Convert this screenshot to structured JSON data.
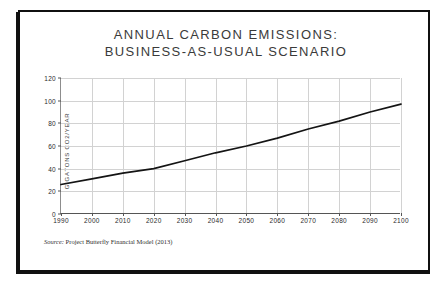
{
  "figure": {
    "title_line1": "ANNUAL CARBON EMISSIONS:",
    "title_line2": "BUSINESS-AS-USUAL SCENARIO",
    "source_label": "Source:",
    "source_text": "Project Butterfly Financial Model (2013)",
    "line_color": "#141414",
    "grid_color": "#d2d2d2",
    "axis_color": "#555555",
    "frame_color": "#101010",
    "background": "#ffffff"
  },
  "chart_data": {
    "type": "line",
    "title": "ANNUAL CARBON EMISSIONS: BUSINESS-AS-USUAL SCENARIO",
    "xlabel": "",
    "ylabel": "GIGATONS CO2/YEAR",
    "x": [
      1990,
      2000,
      2010,
      2020,
      2030,
      2040,
      2050,
      2060,
      2070,
      2080,
      2090,
      2100
    ],
    "values": [
      26,
      31,
      36,
      40,
      47,
      54,
      60,
      67,
      75,
      82,
      90,
      97
    ],
    "series": [
      {
        "name": "Business-as-usual emissions",
        "values": [
          26,
          31,
          36,
          40,
          47,
          54,
          60,
          67,
          75,
          82,
          90,
          97
        ]
      }
    ],
    "xlim": [
      1990,
      2100
    ],
    "ylim": [
      0,
      120
    ],
    "xticks": [
      1990,
      2000,
      2010,
      2020,
      2030,
      2040,
      2050,
      2060,
      2070,
      2080,
      2090,
      2100
    ],
    "yticks": [
      0,
      20,
      40,
      60,
      80,
      100,
      120
    ],
    "xtick_labels": [
      "1990",
      "2000",
      "2010",
      "2020",
      "2030",
      "2040",
      "2050",
      "2060",
      "2070",
      "2080",
      "2090",
      "2100"
    ],
    "ytick_labels": [
      "0",
      "20",
      "40",
      "60",
      "80",
      "100",
      "120"
    ],
    "grid": true,
    "legend": false,
    "legend_position": "none"
  }
}
